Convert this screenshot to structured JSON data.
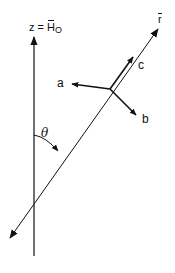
{
  "diagram": {
    "type": "vector-geometry",
    "labels": {
      "z_axis_prefix": "z = ",
      "z_axis_H": "H",
      "z_axis_sub": "O",
      "r_axis": "r",
      "vector_a": "a",
      "vector_b": "b",
      "vector_c": "c",
      "angle": "θ"
    },
    "elements": [
      {
        "name": "z-axis",
        "description": "vertical axis pointing up, labeled z = Ĥ_O"
      },
      {
        "name": "r-axis",
        "description": "diagonal line through origin with arrows at both ends, labeled r̂"
      },
      {
        "name": "vector-a",
        "description": "vector from triad origin pointing left"
      },
      {
        "name": "vector-b",
        "description": "vector from triad origin pointing down-right"
      },
      {
        "name": "vector-c",
        "description": "vector from triad origin along r̂ direction"
      },
      {
        "name": "angle-theta",
        "description": "arc between z-axis and r-axis with arrowhead, labeled θ"
      }
    ],
    "colors": {
      "line": "#111111",
      "background": "#ffffff"
    }
  }
}
